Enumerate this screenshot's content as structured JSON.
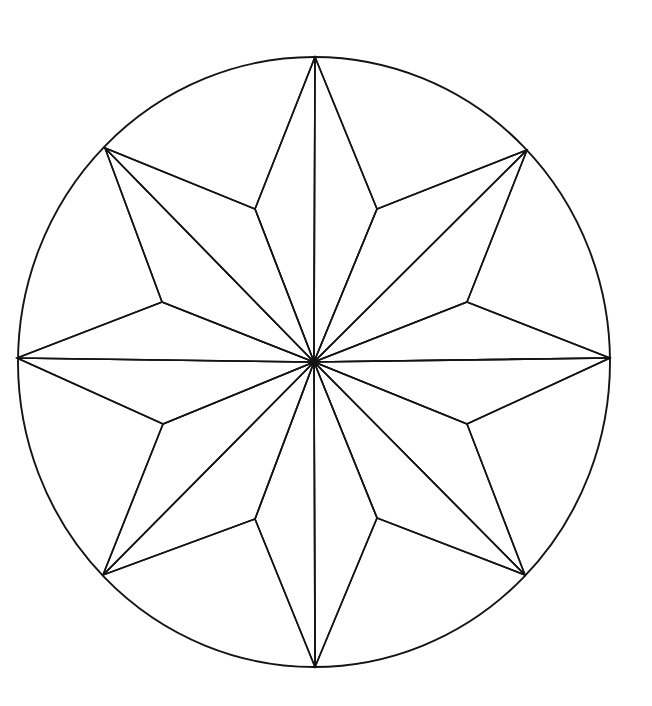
{
  "figure": {
    "kind": "line-drawing",
    "background_color": "#ffffff",
    "stroke_color": "#141414",
    "stroke_width": 1.6,
    "canvas": {
      "width": 652,
      "height": 706
    }
  },
  "geometry": {
    "center": {
      "x": 314,
      "y": 362
    },
    "circle": {
      "cx": 314,
      "cy": 362,
      "rx": 296,
      "ry": 305
    },
    "point_count": 8,
    "outer_points": [
      {
        "name": "north",
        "label": "N",
        "x": 315,
        "y": 57
      },
      {
        "name": "northeast",
        "label": "NE",
        "x": 527,
        "y": 150
      },
      {
        "name": "east",
        "label": "E",
        "x": 610,
        "y": 358
      },
      {
        "name": "southeast",
        "label": "SE",
        "x": 525,
        "y": 575
      },
      {
        "name": "south",
        "label": "S",
        "x": 315,
        "y": 667
      },
      {
        "name": "southwest",
        "label": "SW",
        "x": 103,
        "y": 575
      },
      {
        "name": "west",
        "label": "W",
        "x": 17,
        "y": 358
      },
      {
        "name": "northwest",
        "label": "NW",
        "x": 105,
        "y": 148
      }
    ],
    "inner_points": [
      {
        "name": "inner-n-ne",
        "x": 377,
        "y": 209
      },
      {
        "name": "inner-ne-e",
        "x": 467,
        "y": 302
      },
      {
        "name": "inner-e-se",
        "x": 467,
        "y": 424
      },
      {
        "name": "inner-se-s",
        "x": 377,
        "y": 518
      },
      {
        "name": "inner-s-sw",
        "x": 255,
        "y": 519
      },
      {
        "name": "inner-sw-w",
        "x": 163,
        "y": 424
      },
      {
        "name": "inner-w-nw",
        "x": 162,
        "y": 302
      },
      {
        "name": "inner-nw-n",
        "x": 255,
        "y": 209
      }
    ],
    "facets": [
      {
        "name": "facet-north-left",
        "path": "M 314 362 L 255 209 L 315 57 Z"
      },
      {
        "name": "facet-north-right",
        "path": "M 314 362 L 315 57 L 377 209 Z"
      },
      {
        "name": "facet-northeast-left",
        "path": "M 314 362 L 377 209 L 527 150 Z"
      },
      {
        "name": "facet-northeast-right",
        "path": "M 314 362 L 527 150 L 467 302 Z"
      },
      {
        "name": "facet-east-left",
        "path": "M 314 362 L 467 302 L 610 358 Z"
      },
      {
        "name": "facet-east-right",
        "path": "M 314 362 L 610 358 L 467 424 Z"
      },
      {
        "name": "facet-southeast-left",
        "path": "M 314 362 L 467 424 L 525 575 Z"
      },
      {
        "name": "facet-southeast-right",
        "path": "M 314 362 L 525 575 L 377 518 Z"
      },
      {
        "name": "facet-south-left",
        "path": "M 314 362 L 377 518 L 315 667 Z"
      },
      {
        "name": "facet-south-right",
        "path": "M 314 362 L 315 667 L 255 519 Z"
      },
      {
        "name": "facet-southwest-left",
        "path": "M 314 362 L 255 519 L 103 575 Z"
      },
      {
        "name": "facet-southwest-right",
        "path": "M 314 362 L 103 575 L 163 424 Z"
      },
      {
        "name": "facet-west-left",
        "path": "M 314 362 L 163 424 L 17 358 Z"
      },
      {
        "name": "facet-west-right",
        "path": "M 314 362 L 17 358 L 162 302 Z"
      },
      {
        "name": "facet-northwest-left",
        "path": "M 314 362 L 162 302 L 105 148 Z"
      },
      {
        "name": "facet-northwest-right",
        "path": "M 314 362 L 105 148 L 255 209 Z"
      }
    ],
    "star_outline": "M 315 57 L 377 209 L 527 150 L 467 302 L 610 358 L 467 424 L 525 575 L 377 518 L 315 667 L 255 519 L 103 575 L 163 424 L 17 358 L 162 302 L 105 148 L 255 209 Z",
    "rays": [
      {
        "name": "ray-to-north",
        "x2": 315,
        "y2": 57
      },
      {
        "name": "ray-to-inner-n-ne",
        "x2": 377,
        "y2": 209
      },
      {
        "name": "ray-to-northeast",
        "x2": 527,
        "y2": 150
      },
      {
        "name": "ray-to-inner-ne-e",
        "x2": 467,
        "y2": 302
      },
      {
        "name": "ray-to-east",
        "x2": 610,
        "y2": 358
      },
      {
        "name": "ray-to-inner-e-se",
        "x2": 467,
        "y2": 424
      },
      {
        "name": "ray-to-southeast",
        "x2": 525,
        "y2": 575
      },
      {
        "name": "ray-to-inner-se-s",
        "x2": 377,
        "y2": 518
      },
      {
        "name": "ray-to-south",
        "x2": 315,
        "y2": 667
      },
      {
        "name": "ray-to-inner-s-sw",
        "x2": 255,
        "y2": 519
      },
      {
        "name": "ray-to-southwest",
        "x2": 103,
        "y2": 575
      },
      {
        "name": "ray-to-inner-sw-w",
        "x2": 163,
        "y2": 424
      },
      {
        "name": "ray-to-west",
        "x2": 17,
        "y2": 358
      },
      {
        "name": "ray-to-inner-w-nw",
        "x2": 162,
        "y2": 302
      },
      {
        "name": "ray-to-northwest",
        "x2": 105,
        "y2": 148
      },
      {
        "name": "ray-to-inner-nw-n",
        "x2": 255,
        "y2": 209
      }
    ]
  }
}
